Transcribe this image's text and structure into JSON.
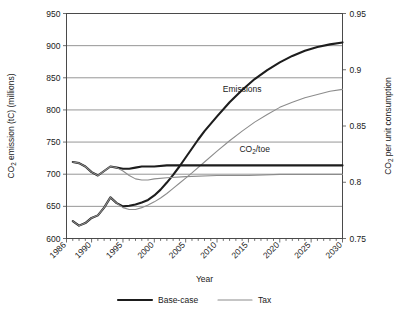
{
  "chart_data": {
    "type": "line",
    "title": "",
    "xlabel": "Year",
    "ylabel": "CO2 emission (tC) (millions)",
    "y2label": "CO2 per unit consumption",
    "xlim": [
      1986,
      2030
    ],
    "ylim": [
      600,
      950
    ],
    "y2lim": [
      0.75,
      0.95
    ],
    "grid": true,
    "legend_position": "bottom",
    "xticks": [
      "1986",
      "1990",
      "1995",
      "2000",
      "2005",
      "2010",
      "2015",
      "2020",
      "2025",
      "2030"
    ],
    "xtick_values": [
      1986,
      1990,
      1995,
      2000,
      2005,
      2010,
      2015,
      2020,
      2025,
      2030
    ],
    "yticks": [
      "600",
      "650",
      "700",
      "750",
      "800",
      "850",
      "900",
      "950"
    ],
    "ytick_values": [
      600,
      650,
      700,
      750,
      800,
      850,
      900,
      950
    ],
    "y2ticks": [
      "0.75",
      "0.8",
      "0.85",
      "0.9",
      "0.95"
    ],
    "y2tick_values": [
      0.75,
      0.8,
      0.85,
      0.9,
      0.95
    ],
    "annotations": [
      {
        "text": "Emissions",
        "x": 2014,
        "y": 828
      },
      {
        "text": "CO2/toe",
        "x": 2016,
        "y": 735
      }
    ],
    "legend": [
      {
        "label": "Base-case",
        "color": "#1d1d1d",
        "width": 2.1
      },
      {
        "label": "Tax",
        "color": "#8c8c8c",
        "width": 1.1
      }
    ],
    "series": [
      {
        "name": "Emissions Base-case",
        "axis": "left",
        "style": "Base-case",
        "x": [
          1987,
          1988,
          1989,
          1990,
          1991,
          1992,
          1993,
          1994,
          1995,
          1996,
          1997,
          1998,
          1999,
          2000,
          2001,
          2002,
          2003,
          2004,
          2005,
          2006,
          2007,
          2008,
          2010,
          2012,
          2014,
          2016,
          2018,
          2020,
          2022,
          2024,
          2026,
          2028,
          2030
        ],
        "y": [
          627,
          620,
          624,
          632,
          636,
          648,
          664,
          655,
          650,
          651,
          653,
          656,
          660,
          667,
          676,
          687,
          699,
          712,
          726,
          740,
          754,
          767,
          790,
          812,
          831,
          848,
          862,
          874,
          884,
          892,
          898,
          902,
          905
        ]
      },
      {
        "name": "Emissions Tax",
        "axis": "left",
        "style": "Tax",
        "x": [
          1987,
          1988,
          1989,
          1990,
          1991,
          1992,
          1993,
          1994,
          1995,
          1996,
          1997,
          1998,
          1999,
          2000,
          2001,
          2002,
          2003,
          2004,
          2005,
          2006,
          2008,
          2010,
          2012,
          2014,
          2016,
          2018,
          2020,
          2022,
          2024,
          2026,
          2028,
          2030
        ],
        "y": [
          627,
          620,
          624,
          632,
          636,
          648,
          664,
          655,
          648,
          645,
          645,
          648,
          652,
          657,
          663,
          670,
          678,
          686,
          694,
          702,
          719,
          736,
          752,
          767,
          781,
          793,
          804,
          812,
          819,
          824,
          829,
          832
        ]
      },
      {
        "name": "CO2/toe Base-case",
        "axis": "right",
        "style": "Base-case",
        "x": [
          1987,
          1988,
          1989,
          1990,
          1991,
          1992,
          1993,
          1994,
          1995,
          1996,
          1997,
          1998,
          2000,
          2002,
          2005,
          2010,
          2015,
          2020,
          2025,
          2030
        ],
        "y": [
          0.818,
          0.817,
          0.814,
          0.809,
          0.806,
          0.81,
          0.814,
          0.813,
          0.812,
          0.812,
          0.813,
          0.814,
          0.814,
          0.815,
          0.815,
          0.815,
          0.815,
          0.815,
          0.815,
          0.815
        ]
      },
      {
        "name": "CO2/toe Tax",
        "axis": "right",
        "style": "Tax",
        "x": [
          1987,
          1988,
          1989,
          1990,
          1991,
          1992,
          1993,
          1994,
          1995,
          1996,
          1997,
          1998,
          1999,
          2000,
          2002,
          2005,
          2010,
          2015,
          2020,
          2025,
          2030
        ],
        "y": [
          0.818,
          0.817,
          0.814,
          0.809,
          0.806,
          0.81,
          0.814,
          0.813,
          0.81,
          0.806,
          0.803,
          0.802,
          0.802,
          0.803,
          0.804,
          0.805,
          0.806,
          0.806,
          0.807,
          0.807,
          0.807
        ]
      }
    ]
  }
}
